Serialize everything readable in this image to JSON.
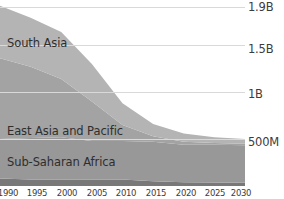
{
  "chart_data": {
    "type": "area",
    "title": "",
    "subtitle": "",
    "xlabel": "",
    "ylabel": "",
    "stacked": true,
    "grid": true,
    "legend_position": "inline-labels",
    "x": [
      1990,
      1995,
      2000,
      2005,
      2010,
      2015,
      2020,
      2025,
      2030
    ],
    "xlim": [
      1990,
      2030
    ],
    "ylim": [
      0,
      1980000000
    ],
    "yticks": [
      {
        "value": 1900000000,
        "label": "1.9B"
      },
      {
        "value": 1500000000,
        "label": "1.5B"
      },
      {
        "value": 1000000000,
        "label": "1B"
      },
      {
        "value": 500000000,
        "label": "500M"
      }
    ],
    "ytick_labels": [
      "1.9B",
      "1.5B",
      "1B",
      "500M"
    ],
    "xtick_labels": [
      "1990",
      "1995",
      "2000",
      "2005",
      "2010",
      "2015",
      "2020",
      "2025",
      "2030"
    ],
    "totals": [
      1920000000,
      1790000000,
      1640000000,
      1300000000,
      880000000,
      660000000,
      560000000,
      520000000,
      500000000
    ],
    "series": [
      {
        "name": "South Asia",
        "color": "#b4b4b4",
        "label_visible": true,
        "values": [
          560000000,
          520000000,
          500000000,
          400000000,
          230000000,
          130000000,
          90000000,
          62000000,
          50000000
        ]
      },
      {
        "name": "East Asia and Pacific",
        "color": "#a3a3a3",
        "label_visible": true,
        "values": [
          860000000,
          760000000,
          620000000,
          420000000,
          170000000,
          60000000,
          30000000,
          20000000,
          15000000
        ]
      },
      {
        "name": "Sub-Saharan Africa",
        "color": "#989898",
        "label_visible": true,
        "values": [
          420000000,
          440000000,
          450000000,
          410000000,
          410000000,
          420000000,
          400000000,
          400000000,
          400000000
        ]
      },
      {
        "name": "Other regions",
        "color": "#787878",
        "label_visible": false,
        "values": [
          80000000,
          70000000,
          70000000,
          70000000,
          70000000,
          50000000,
          40000000,
          38000000,
          35000000
        ]
      }
    ]
  },
  "yticks": {
    "t0": "1.9B",
    "t1": "1.5B",
    "t2": "1B",
    "t3": "500M"
  },
  "labels": {
    "south_asia": "South Asia",
    "east_asia": "East Asia and Pacific",
    "sub_saharan": "Sub-Saharan Africa"
  },
  "xticks": {
    "x0": "1990",
    "x1": "1995",
    "x2": "2000",
    "x3": "2005",
    "x4": "2010",
    "x5": "2015",
    "x6": "2020",
    "x7": "2025",
    "x8": "2030"
  }
}
